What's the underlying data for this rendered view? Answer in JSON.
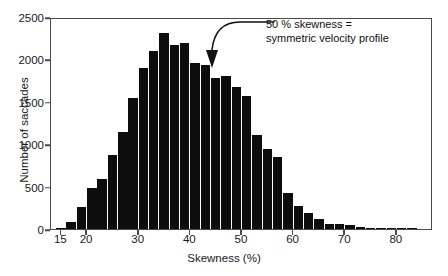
{
  "figure": {
    "background": "#ffffff",
    "bar_color": "#0d0d0d",
    "axis_color": "#4a4a4a",
    "text_color": "#1a1a1a"
  },
  "annotation": {
    "line1": "50 % skewness =",
    "line2": "symmetric velocity profile",
    "arrow_target_x": 47,
    "arrow_icon": "curved-down-arrow-icon"
  },
  "chart_data": {
    "type": "bar",
    "title": "",
    "subtitle": "",
    "xlabel": "Skewness (%)",
    "ylabel": "Number of saccades",
    "xlim": [
      13,
      87
    ],
    "ylim": [
      0,
      2500
    ],
    "grid": false,
    "legend": "none",
    "bin_width": 2,
    "xticks": [
      15,
      20,
      30,
      40,
      50,
      60,
      70,
      80
    ],
    "xtick_labels": [
      "15",
      "20",
      "30",
      "40",
      "50",
      "60",
      "70",
      "80"
    ],
    "yticks": [
      0,
      500,
      1000,
      1500,
      2000,
      2500
    ],
    "ytick_labels": [
      "0",
      "500",
      "1000",
      "1500",
      "2000",
      "2500"
    ],
    "categories": [
      "15",
      "17",
      "19",
      "21",
      "23",
      "25",
      "27",
      "29",
      "31",
      "33",
      "35",
      "37",
      "39",
      "41",
      "43",
      "45",
      "47",
      "49",
      "51",
      "53",
      "55",
      "57",
      "59",
      "61",
      "63",
      "65",
      "67",
      "69",
      "71",
      "73",
      "75",
      "77",
      "79",
      "81",
      "83"
    ],
    "values": [
      10,
      85,
      265,
      485,
      595,
      870,
      1140,
      1545,
      1900,
      2100,
      2310,
      2170,
      2190,
      1960,
      1930,
      1780,
      1800,
      1670,
      1570,
      1110,
      940,
      850,
      430,
      275,
      190,
      115,
      65,
      55,
      50,
      25,
      12,
      6,
      4,
      2,
      1
    ],
    "annotations": [
      {
        "text": "50 % skewness = symmetric velocity profile",
        "points_to_x": 47
      }
    ]
  }
}
